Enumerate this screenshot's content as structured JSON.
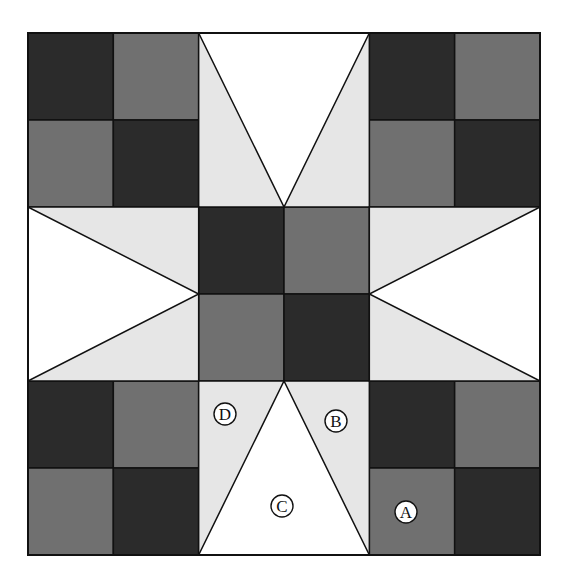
{
  "diagram": {
    "type": "quilt-block",
    "grid": {
      "cols": 6,
      "rows": 6,
      "x": 28,
      "y": 33,
      "width": 512,
      "height": 522
    },
    "colors": {
      "dark": "#2b2b2b",
      "medium": "#707070",
      "light": "#e6e6e6",
      "white": "#ffffff",
      "stroke": "#111111"
    },
    "squares": [
      {
        "col": 0,
        "row": 0,
        "tone": "dark"
      },
      {
        "col": 1,
        "row": 0,
        "tone": "medium"
      },
      {
        "col": 0,
        "row": 1,
        "tone": "medium"
      },
      {
        "col": 1,
        "row": 1,
        "tone": "dark"
      },
      {
        "col": 4,
        "row": 0,
        "tone": "dark"
      },
      {
        "col": 5,
        "row": 0,
        "tone": "medium"
      },
      {
        "col": 4,
        "row": 1,
        "tone": "medium"
      },
      {
        "col": 5,
        "row": 1,
        "tone": "dark"
      },
      {
        "col": 0,
        "row": 4,
        "tone": "dark"
      },
      {
        "col": 1,
        "row": 4,
        "tone": "medium"
      },
      {
        "col": 0,
        "row": 5,
        "tone": "medium"
      },
      {
        "col": 1,
        "row": 5,
        "tone": "dark"
      },
      {
        "col": 4,
        "row": 4,
        "tone": "dark"
      },
      {
        "col": 5,
        "row": 4,
        "tone": "medium"
      },
      {
        "col": 4,
        "row": 5,
        "tone": "medium"
      },
      {
        "col": 5,
        "row": 5,
        "tone": "dark"
      },
      {
        "col": 2,
        "row": 2,
        "tone": "dark"
      },
      {
        "col": 3,
        "row": 2,
        "tone": "medium"
      },
      {
        "col": 2,
        "row": 3,
        "tone": "medium"
      },
      {
        "col": 3,
        "row": 3,
        "tone": "dark"
      }
    ],
    "star_points": [
      {
        "name": "top",
        "col": 2,
        "row": 0,
        "w": 2,
        "h": 2,
        "apex": "bottom"
      },
      {
        "name": "bottom",
        "col": 2,
        "row": 4,
        "w": 2,
        "h": 2,
        "apex": "top"
      },
      {
        "name": "left",
        "col": 0,
        "row": 2,
        "w": 2,
        "h": 2,
        "apex": "right"
      },
      {
        "name": "right",
        "col": 4,
        "row": 2,
        "w": 2,
        "h": 2,
        "apex": "left"
      }
    ],
    "labels": [
      {
        "text": "A",
        "x": 406,
        "y": 512
      },
      {
        "text": "B",
        "x": 336,
        "y": 421
      },
      {
        "text": "C",
        "x": 282,
        "y": 506
      },
      {
        "text": "D",
        "x": 225,
        "y": 414
      }
    ]
  }
}
